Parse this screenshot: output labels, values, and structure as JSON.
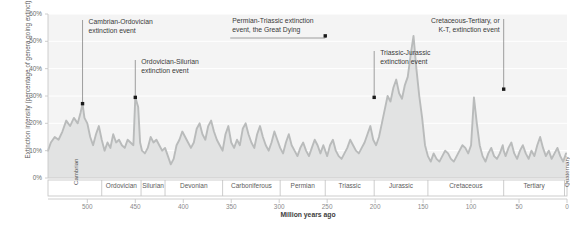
{
  "chart_data": {
    "type": "area",
    "title": "",
    "xlabel": "Million years ago",
    "ylabel": "Extinction intensity (percentage of genera going extinct)",
    "xlim": [
      541,
      0
    ],
    "ylim": [
      0,
      60
    ],
    "x_reversed": true,
    "grid": true,
    "legend": "none",
    "x_ticks": [
      "500",
      "450",
      "400",
      "350",
      "300",
      "250",
      "200",
      "150",
      "100",
      "50",
      "0"
    ],
    "x_tick_values": [
      500,
      450,
      400,
      350,
      300,
      250,
      200,
      150,
      100,
      50,
      0
    ],
    "y_ticks": [
      "0%",
      "10%",
      "20%",
      "30%",
      "40%",
      "50%",
      "60%"
    ],
    "y_tick_values": [
      0,
      10,
      20,
      30,
      40,
      50,
      60
    ],
    "series_name": "Extinction intensity",
    "line_color": "#b9bbbb",
    "fill_color": "#e2e3e3",
    "marker_color": "#1a1a1a",
    "x": [
      541,
      538,
      534,
      530,
      526,
      522,
      518,
      514,
      510,
      507,
      505,
      503,
      500,
      497,
      494,
      491,
      488,
      485,
      482,
      479,
      476,
      473,
      470,
      467,
      464,
      461,
      458,
      455,
      452,
      450,
      447,
      445,
      443,
      440,
      437,
      434,
      431,
      428,
      425,
      422,
      419,
      416,
      413,
      410,
      407,
      404,
      401,
      398,
      395,
      392,
      389,
      386,
      383,
      380,
      377,
      374,
      371,
      368,
      365,
      362,
      359,
      356,
      353,
      350,
      347,
      344,
      341,
      338,
      335,
      332,
      329,
      326,
      323,
      320,
      317,
      314,
      311,
      308,
      305,
      302,
      299,
      296,
      293,
      290,
      287,
      284,
      281,
      278,
      275,
      272,
      269,
      266,
      263,
      260,
      257,
      254,
      252,
      250,
      247,
      244,
      241,
      238,
      235,
      232,
      229,
      226,
      223,
      220,
      217,
      214,
      211,
      208,
      205,
      202,
      199,
      196,
      193,
      190,
      187,
      184,
      181,
      178,
      175,
      172,
      169,
      166,
      163,
      160,
      157,
      154,
      151,
      148,
      145,
      142,
      139,
      136,
      133,
      130,
      127,
      124,
      121,
      118,
      115,
      112,
      109,
      106,
      103,
      100,
      97,
      94,
      91,
      88,
      85,
      82,
      79,
      76,
      73,
      70,
      67,
      66,
      64,
      61,
      58,
      55,
      52,
      49,
      46,
      43,
      40,
      37,
      34,
      31,
      28,
      25,
      22,
      19,
      16,
      13,
      10,
      7,
      4,
      1
    ],
    "y": [
      10,
      13,
      15,
      14,
      17,
      21,
      19,
      22,
      20,
      24,
      27.2,
      22,
      20,
      15,
      12,
      16,
      19,
      14,
      10,
      13,
      11,
      16,
      13,
      14,
      12,
      11,
      14,
      13,
      12,
      29.5,
      26,
      13,
      10,
      9,
      11,
      15,
      13,
      14,
      12,
      10,
      11,
      8,
      5,
      7,
      12,
      14,
      17,
      15,
      13,
      11,
      13,
      18,
      20,
      16,
      14,
      19,
      21,
      17,
      14,
      12,
      10,
      16,
      19,
      13,
      11,
      14,
      12,
      18,
      20,
      16,
      13,
      11,
      16,
      19,
      15,
      12,
      10,
      13,
      17,
      14,
      11,
      9,
      13,
      16,
      12,
      10,
      8,
      11,
      13,
      10,
      8,
      11,
      14,
      12,
      9,
      12,
      10,
      8,
      12,
      14,
      10,
      8,
      7,
      9,
      11,
      14,
      12,
      10,
      9,
      11,
      13,
      16,
      19,
      14,
      12,
      15,
      20,
      25,
      30,
      28,
      33,
      36,
      31,
      29,
      34,
      37,
      45,
      52,
      40,
      30,
      22,
      12,
      8,
      6,
      9,
      7,
      6,
      8,
      10,
      9,
      7,
      6,
      8,
      10,
      12,
      11,
      9,
      12,
      29.5,
      20,
      12,
      8,
      6,
      9,
      11,
      8,
      7,
      9,
      12,
      10,
      8,
      11,
      13,
      9,
      7,
      10,
      12,
      9,
      7,
      10,
      8,
      12,
      15,
      11,
      8,
      10,
      7,
      9,
      11,
      8,
      6,
      9,
      11,
      8,
      10,
      13,
      32.5,
      12,
      6,
      5,
      7,
      6,
      5,
      8,
      11,
      14,
      10,
      6,
      5,
      7,
      5,
      4,
      6,
      8,
      7,
      5,
      6,
      8,
      7
    ]
  },
  "geologic_periods": [
    {
      "name": "Cambrian",
      "start": 541,
      "end": 485,
      "orientation": "vertical"
    },
    {
      "name": "Ordovician",
      "start": 485,
      "end": 444,
      "orientation": "horizontal"
    },
    {
      "name": "Silurian",
      "start": 444,
      "end": 419,
      "orientation": "horizontal"
    },
    {
      "name": "Devonian",
      "start": 419,
      "end": 359,
      "orientation": "horizontal"
    },
    {
      "name": "Carboniferous",
      "start": 359,
      "end": 299,
      "orientation": "horizontal"
    },
    {
      "name": "Permian",
      "start": 299,
      "end": 252,
      "orientation": "horizontal"
    },
    {
      "name": "Triassic",
      "start": 252,
      "end": 201,
      "orientation": "horizontal"
    },
    {
      "name": "Jurassic",
      "start": 201,
      "end": 145,
      "orientation": "horizontal"
    },
    {
      "name": "Cretaceous",
      "start": 145,
      "end": 66,
      "orientation": "horizontal"
    },
    {
      "name": "Tertiary",
      "start": 66,
      "end": 2.6,
      "orientation": "horizontal"
    },
    {
      "name": "Quaternary",
      "start": 2.6,
      "end": 0,
      "orientation": "vertical"
    }
  ],
  "annotations": [
    {
      "id": "cambrian-ordovician",
      "label": "Cambrian-Ordovician\nextinction event",
      "x": 505,
      "y": 27.2,
      "align": "left",
      "leader": "vertical"
    },
    {
      "id": "ordovician-silurian",
      "label": "Ordovician-Silurian\nextinction event",
      "x": 450,
      "y": 29.5,
      "align": "left",
      "leader": "vertical"
    },
    {
      "id": "permian-triassic",
      "label": "Permian-Triassic extinction\nevent, the Great Dying",
      "x": 252,
      "y": 52,
      "align": "left",
      "leader": "elbow-left"
    },
    {
      "id": "triassic-jurassic",
      "label": "Triassic-Jurassic\nextinction event",
      "x": 201,
      "y": 29.5,
      "align": "left",
      "leader": "vertical"
    },
    {
      "id": "cretaceous-tertiary",
      "label": "Cretaceous-Tertiary, or\nK-T, extinction event",
      "x": 66,
      "y": 32.5,
      "align": "right",
      "leader": "vertical"
    }
  ],
  "colors": {
    "plot_background": "#f4f4f4",
    "area_fill": "#e2e3e3",
    "line": "#b9bbbb",
    "grid": "#ffffff",
    "axis": "#c8c8c8",
    "band_border": "#c0c0c0",
    "text": "#4a4a4a",
    "marker": "#1a1a1a"
  }
}
